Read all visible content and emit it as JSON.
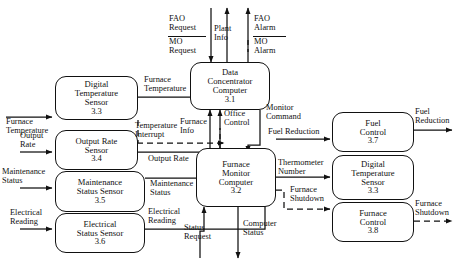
{
  "diagram": {
    "type": "data-flow-diagram",
    "processes": [
      {
        "id": "3.3L",
        "name": "digital-temperature-sensor-left",
        "line1": "Digital",
        "line2": "Temperature",
        "line3": "Sensor",
        "number": "3.3"
      },
      {
        "id": "3.4",
        "name": "output-rate-sensor",
        "line1": "Output Rate",
        "line2": "Sensor",
        "line3": "",
        "number": "3.4"
      },
      {
        "id": "3.5",
        "name": "maintenance-status-sensor",
        "line1": "Maintenance",
        "line2": "Status Sensor",
        "line3": "",
        "number": "3.5"
      },
      {
        "id": "3.6",
        "name": "electrical-status-sensor",
        "line1": "Electrical",
        "line2": "Status Sensor",
        "line3": "",
        "number": "3.6"
      },
      {
        "id": "3.1",
        "name": "data-concentrator-computer",
        "line1": "Data",
        "line2": "Concentrator",
        "line3": "Computer",
        "number": "3.1"
      },
      {
        "id": "3.2",
        "name": "furnace-monitor-computer",
        "line1": "Furnace",
        "line2": "Monitor",
        "line3": "Computer",
        "number": "3.2"
      },
      {
        "id": "3.7",
        "name": "fuel-control",
        "line1": "Fuel",
        "line2": "Control",
        "line3": "",
        "number": "3.7"
      },
      {
        "id": "3.3R",
        "name": "digital-temperature-sensor-right",
        "line1": "Digital",
        "line2": "Temperature",
        "line3": "Sensor",
        "number": "3.3"
      },
      {
        "id": "3.8",
        "name": "furnace-control",
        "line1": "Furnace",
        "line2": "Control",
        "line3": "",
        "number": "3.8"
      }
    ],
    "flows": {
      "furnace_temperature_in_l1": "Furnace",
      "furnace_temperature_in_l2": "Temperature",
      "output_rate_in_l1": "Output",
      "output_rate_in_l2": "Rate",
      "maintenance_status_in_l1": "Maintenance",
      "maintenance_status_in_l2": "Status",
      "electrical_reading_in_l1": "Electrical",
      "electrical_reading_in_l2": "Reading",
      "furnace_temperature_mid_l1": "Furnace",
      "furnace_temperature_mid_l2": "Temperature",
      "temperature_interrupt_l1": "Temperature",
      "temperature_interrupt_l2": "Interrupt",
      "output_rate_mid": "Output Rate",
      "maintenance_status_mid_l1": "Maintenance",
      "maintenance_status_mid_l2": "Status",
      "electrical_reading_mid_l1": "Electrical",
      "electrical_reading_mid_l2": "Reading",
      "fao_request_l1": "FAO",
      "fao_request_l2": "Request",
      "mo_request_l1": "MO",
      "mo_request_l2": "Request",
      "plant_info_l1": "Plant",
      "plant_info_l2": "Info",
      "fao_alarm_l1": "FAO",
      "fao_alarm_l2": "Alarm",
      "mo_alarm_l1": "MO",
      "mo_alarm_l2": "Alarm",
      "furnace_info_l1": "Furnace",
      "furnace_info_l2": "Info",
      "office_control_l1": "Office",
      "office_control_l2": "Control",
      "monitor_command_l1": "Monitor",
      "monitor_command_l2": "Command",
      "fuel_reduction_mid": "Fuel Reduction",
      "thermometer_number_l1": "Thermometer",
      "thermometer_number_l2": "Number",
      "furnace_shutdown_mid_l1": "Furnace",
      "furnace_shutdown_mid_l2": "Shutdown",
      "status_request_l1": "Status",
      "status_request_l2": "Request",
      "computer_status_l1": "Computer",
      "computer_status_l2": "Status",
      "fuel_reduction_out_l1": "Fuel",
      "fuel_reduction_out_l2": "Reduction",
      "furnace_shutdown_out_l1": "Furnace",
      "furnace_shutdown_out_l2": "Shutdown"
    }
  }
}
